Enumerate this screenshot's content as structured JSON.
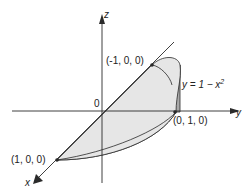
{
  "diagram": {
    "axes": {
      "x": {
        "label": "x"
      },
      "y": {
        "label": "y"
      },
      "z": {
        "label": "z"
      },
      "origin": "0"
    },
    "points": [
      {
        "name": "minus-one-x",
        "label": "(-1, 0, 0)"
      },
      {
        "name": "one-y",
        "label": "(0, 1, 0)"
      },
      {
        "name": "one-x",
        "label": "(1, 0, 0)"
      }
    ],
    "curve_label": {
      "prefix": "y = 1 − x",
      "sup": "2"
    },
    "colors": {
      "light_fill": "#e6e6e6",
      "dark_fill": "#a9a9a9",
      "stroke": "#2a2a2a"
    }
  }
}
